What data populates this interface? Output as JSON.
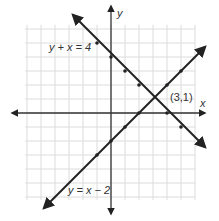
{
  "chart_data": {
    "type": "line",
    "title": "",
    "xlabel": "x",
    "ylabel": "y",
    "xlim": [
      -6,
      6
    ],
    "ylim": [
      -6,
      6
    ],
    "grid": true,
    "series": [
      {
        "name": "y + x = 4",
        "equation": "y = -x + 4",
        "points": [
          [
            -1,
            5
          ],
          [
            0,
            4
          ],
          [
            1,
            3
          ],
          [
            2,
            2
          ],
          [
            3,
            1
          ],
          [
            4,
            0
          ],
          [
            5,
            -1
          ]
        ]
      },
      {
        "name": "y = x − 2",
        "equation": "y = x - 2",
        "points": [
          [
            -1,
            -3
          ],
          [
            0,
            -2
          ],
          [
            1,
            -1
          ],
          [
            2,
            0
          ],
          [
            3,
            1
          ],
          [
            4,
            2
          ],
          [
            5,
            3
          ]
        ]
      }
    ],
    "annotations": [
      {
        "text": "(3,1)",
        "x": 3,
        "y": 1,
        "note": "intersection point"
      }
    ]
  },
  "labels": {
    "x_axis": "x",
    "y_axis": "y",
    "line1": "y + x = 4",
    "line2": "y = x − 2",
    "intersection": "(3,1)"
  },
  "colors": {
    "grid": "#dcdcdc",
    "axis": "#333333",
    "line": "#222222",
    "text": "#333333"
  }
}
